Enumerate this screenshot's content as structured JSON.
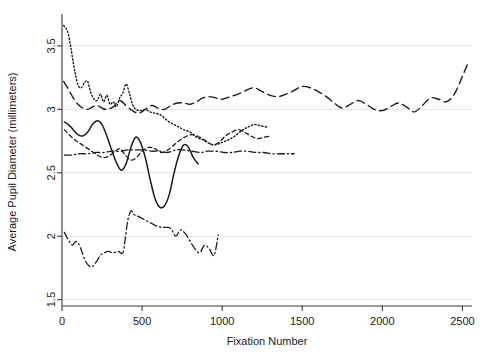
{
  "chart_data": {
    "type": "line",
    "title": "",
    "xlabel": "Fixation Number",
    "ylabel": "Average Pupil Diameter (millimeters)",
    "xlim": [
      0,
      2560
    ],
    "ylim": [
      1.45,
      3.72
    ],
    "xticks": [
      0,
      500,
      1000,
      1500,
      2000,
      2500
    ],
    "xticklabels": [
      "0",
      "500",
      "1000",
      "1500",
      "2000",
      "2500"
    ],
    "yticks": [
      1.5,
      2,
      2.5,
      3,
      3.5
    ],
    "yticklabels": [
      "1.5",
      "2",
      "2.5",
      "3",
      "3.5"
    ],
    "grid": true,
    "grid_axis": "y",
    "legend": "none",
    "series": [
      {
        "name": "participant-dotted",
        "style": "dotted",
        "color": "#1c1c1c",
        "x": [
          10,
          25,
          40,
          55,
          70,
          85,
          100,
          120,
          140,
          160,
          180,
          200,
          220,
          240,
          260,
          280,
          300,
          320,
          340,
          360,
          380,
          400,
          420,
          440,
          460,
          490,
          520,
          550,
          580,
          610,
          640,
          670,
          700,
          730,
          760,
          800,
          840,
          880,
          920,
          960,
          1000,
          1040,
          1080,
          1120,
          1160,
          1200,
          1240,
          1280
        ],
        "y": [
          3.66,
          3.64,
          3.59,
          3.49,
          3.37,
          3.27,
          3.19,
          3.17,
          3.21,
          3.22,
          3.13,
          3.08,
          3.07,
          3.12,
          3.06,
          3.11,
          3.04,
          3.06,
          3.02,
          3.09,
          3.13,
          3.2,
          3.13,
          3.04,
          3.0,
          2.99,
          3.0,
          2.98,
          2.97,
          2.96,
          2.93,
          2.9,
          2.88,
          2.86,
          2.84,
          2.82,
          2.78,
          2.76,
          2.73,
          2.72,
          2.74,
          2.76,
          2.79,
          2.83,
          2.86,
          2.88,
          2.87,
          2.86
        ]
      },
      {
        "name": "participant-long-dash-upper",
        "style": "long-dash",
        "color": "#1c1c1c",
        "x": [
          10,
          40,
          70,
          100,
          130,
          160,
          190,
          220,
          250,
          280,
          320,
          360,
          400,
          440,
          480,
          520,
          560,
          600,
          640,
          680,
          720,
          760,
          800,
          840,
          880,
          920,
          960,
          1000,
          1050,
          1100,
          1150,
          1200,
          1250,
          1300,
          1350,
          1400,
          1450,
          1500,
          1550,
          1600,
          1650,
          1700,
          1750,
          1800,
          1850,
          1900,
          1950,
          2000,
          2050,
          2100,
          2150,
          2200,
          2250,
          2300,
          2350,
          2400,
          2450,
          2500,
          2540
        ],
        "y": [
          3.22,
          3.16,
          3.09,
          3.04,
          3.01,
          3.0,
          3.02,
          3.03,
          3.01,
          3.0,
          3.02,
          3.07,
          3.03,
          2.99,
          2.97,
          3.0,
          3.03,
          3.01,
          3.0,
          3.03,
          3.05,
          3.05,
          3.04,
          3.06,
          3.09,
          3.1,
          3.09,
          3.08,
          3.1,
          3.12,
          3.15,
          3.17,
          3.14,
          3.11,
          3.1,
          3.12,
          3.15,
          3.18,
          3.17,
          3.14,
          3.1,
          3.05,
          3.01,
          3.04,
          3.07,
          3.04,
          3.0,
          2.99,
          3.02,
          3.05,
          3.02,
          2.98,
          3.03,
          3.09,
          3.08,
          3.06,
          3.12,
          3.26,
          3.38
        ]
      },
      {
        "name": "participant-solid",
        "style": "solid",
        "color": "#1c1c1c",
        "x": [
          15,
          40,
          70,
          100,
          130,
          160,
          190,
          220,
          250,
          280,
          310,
          340,
          370,
          400,
          430,
          460,
          490,
          520,
          550,
          580,
          610,
          640,
          670,
          700,
          730,
          760,
          790,
          820,
          850
        ],
        "y": [
          2.9,
          2.88,
          2.84,
          2.8,
          2.79,
          2.82,
          2.88,
          2.91,
          2.88,
          2.79,
          2.68,
          2.58,
          2.52,
          2.57,
          2.7,
          2.78,
          2.74,
          2.62,
          2.45,
          2.3,
          2.23,
          2.24,
          2.33,
          2.5,
          2.64,
          2.72,
          2.7,
          2.62,
          2.57
        ]
      },
      {
        "name": "participant-short-dash-mid",
        "style": "short-dash",
        "color": "#1c1c1c",
        "x": [
          15,
          45,
          80,
          115,
          150,
          185,
          220,
          255,
          290,
          325,
          360,
          395,
          430,
          465,
          500,
          540,
          580,
          620,
          660,
          700,
          740,
          780,
          820,
          860,
          900,
          940,
          980,
          1020,
          1060,
          1100,
          1140,
          1180,
          1220,
          1260,
          1300
        ],
        "y": [
          2.84,
          2.8,
          2.76,
          2.73,
          2.7,
          2.67,
          2.64,
          2.62,
          2.63,
          2.66,
          2.69,
          2.64,
          2.6,
          2.62,
          2.67,
          2.7,
          2.69,
          2.66,
          2.68,
          2.72,
          2.76,
          2.79,
          2.8,
          2.78,
          2.75,
          2.72,
          2.74,
          2.79,
          2.82,
          2.84,
          2.82,
          2.79,
          2.77,
          2.78,
          2.79
        ]
      },
      {
        "name": "participant-dash-dot-flat",
        "style": "dash-dot",
        "color": "#1c1c1c",
        "x": [
          15,
          60,
          110,
          160,
          210,
          260,
          310,
          360,
          410,
          460,
          510,
          560,
          610,
          660,
          710,
          760,
          810,
          860,
          910,
          960,
          1010,
          1060,
          1110,
          1160,
          1210,
          1260,
          1310,
          1360,
          1410,
          1450
        ],
        "y": [
          2.64,
          2.64,
          2.65,
          2.65,
          2.66,
          2.66,
          2.67,
          2.67,
          2.68,
          2.68,
          2.68,
          2.67,
          2.67,
          2.66,
          2.68,
          2.68,
          2.67,
          2.66,
          2.67,
          2.67,
          2.66,
          2.66,
          2.67,
          2.67,
          2.66,
          2.66,
          2.65,
          2.65,
          2.65,
          2.65
        ]
      },
      {
        "name": "participant-dash-dot-lower",
        "style": "dash-dot",
        "color": "#1c1c1c",
        "x": [
          15,
          40,
          65,
          90,
          115,
          140,
          165,
          190,
          215,
          240,
          265,
          290,
          320,
          350,
          380,
          395,
          410,
          430,
          450,
          470,
          500,
          530,
          560,
          590,
          620,
          650,
          680,
          710,
          740,
          770,
          800,
          830,
          860,
          890,
          920,
          950,
          975
        ],
        "y": [
          2.03,
          1.97,
          1.93,
          1.96,
          1.91,
          1.82,
          1.77,
          1.76,
          1.8,
          1.85,
          1.87,
          1.88,
          1.87,
          1.88,
          1.87,
          1.98,
          2.12,
          2.2,
          2.17,
          2.16,
          2.14,
          2.12,
          2.1,
          2.08,
          2.07,
          2.07,
          2.06,
          2.0,
          2.05,
          2.02,
          1.96,
          1.9,
          1.87,
          1.93,
          1.9,
          1.85,
          2.01
        ]
      }
    ]
  }
}
